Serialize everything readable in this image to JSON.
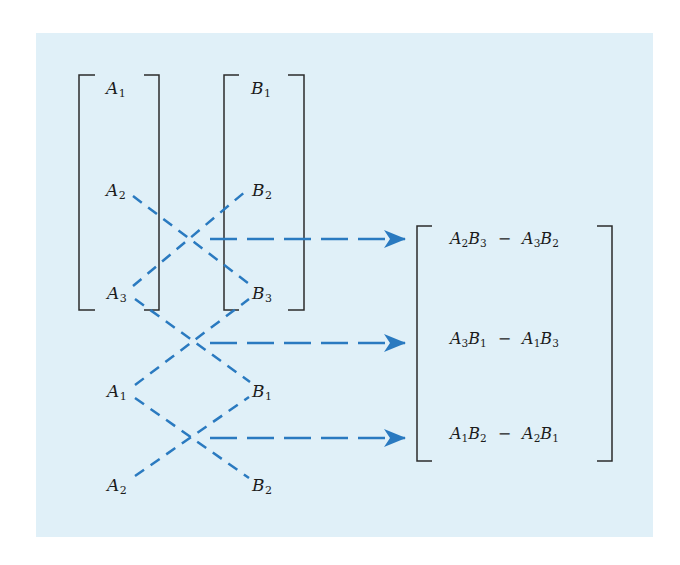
{
  "colors": {
    "panel_background": "#e0f0f8",
    "page_background": "#ffffff",
    "dashed_line": "#2a7ac0",
    "arrow": "#2a7ac0",
    "bracket": "#2b2b2b",
    "text": "#1c1c1c"
  },
  "vector_a": {
    "name": "A",
    "components": [
      {
        "base": "A",
        "sub": "1"
      },
      {
        "base": "A",
        "sub": "2"
      },
      {
        "base": "A",
        "sub": "3"
      }
    ]
  },
  "vector_b": {
    "name": "B",
    "components": [
      {
        "base": "B",
        "sub": "1"
      },
      {
        "base": "B",
        "sub": "2"
      },
      {
        "base": "B",
        "sub": "3"
      }
    ]
  },
  "repeated_rows": {
    "a": [
      {
        "base": "A",
        "sub": "1"
      },
      {
        "base": "A",
        "sub": "2"
      }
    ],
    "b": [
      {
        "base": "B",
        "sub": "1"
      },
      {
        "base": "B",
        "sub": "2"
      }
    ]
  },
  "result_vector": {
    "rows": [
      {
        "t1a": "A",
        "t1as": "2",
        "t1b": "B",
        "t1bs": "3",
        "op": "−",
        "t2a": "A",
        "t2as": "3",
        "t2b": "B",
        "t2bs": "2"
      },
      {
        "t1a": "A",
        "t1as": "3",
        "t1b": "B",
        "t1bs": "1",
        "op": "−",
        "t2a": "A",
        "t2as": "1",
        "t2b": "B",
        "t2bs": "3"
      },
      {
        "t1a": "A",
        "t1as": "1",
        "t1b": "B",
        "t1bs": "2",
        "op": "−",
        "t2a": "A",
        "t2as": "2",
        "t2b": "B",
        "t2bs": "1"
      }
    ],
    "row_text": [
      "A2B3 − A3B2",
      "A3B1 − A1B3",
      "A1B2 − A2B1"
    ]
  },
  "cross_pairs": [
    {
      "from": "A2",
      "to": "B3",
      "with_from": "A3",
      "with_to": "B2",
      "result_row": 1
    },
    {
      "from": "A3",
      "to": "B1",
      "with_from": "A1",
      "with_to": "B3",
      "result_row": 2
    },
    {
      "from": "A1",
      "to": "B2",
      "with_from": "A2",
      "with_to": "B1",
      "result_row": 3
    }
  ]
}
